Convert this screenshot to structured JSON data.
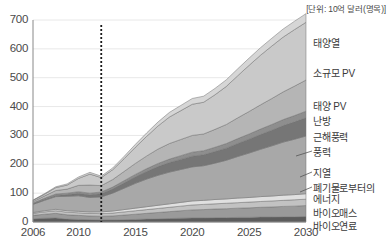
{
  "chart_data": {
    "type": "area",
    "stacked": true,
    "title": "",
    "subtitle": "",
    "unit_note": "[단위: 10억 달러(명목)]",
    "xlabel": "",
    "ylabel": "",
    "xlim": [
      2006,
      2030
    ],
    "ylim": [
      0,
      700
    ],
    "y_ticks": [
      0,
      100,
      200,
      300,
      400,
      500,
      600,
      700
    ],
    "x_ticks": [
      2006,
      2010,
      2015,
      2020,
      2025,
      2030
    ],
    "x_tick_labels": [
      "2006",
      "2010",
      "2015",
      "2020",
      "2025",
      "2030"
    ],
    "y_tick_labels": [
      "0",
      "100",
      "200",
      "300",
      "400",
      "500",
      "600",
      "700"
    ],
    "grid": true,
    "legend_position": "right-inline",
    "annotations": [
      {
        "name": "forecast-divider",
        "type": "vline",
        "x": 2012,
        "style": "dotted",
        "color": "#1a1a1a"
      }
    ],
    "x": [
      2006,
      2007,
      2008,
      2009,
      2010,
      2011,
      2012,
      2013,
      2014,
      2015,
      2016,
      2017,
      2018,
      2019,
      2020,
      2021,
      2022,
      2023,
      2024,
      2025,
      2026,
      2027,
      2028,
      2029,
      2030
    ],
    "series": [
      {
        "name": "바이오연료",
        "color": "#5c5c5c",
        "values": [
          11,
          13,
          14,
          10,
          9,
          8,
          7,
          7,
          8,
          9,
          10,
          11,
          12,
          13,
          14,
          14,
          15,
          15,
          16,
          16,
          17,
          17,
          18,
          18,
          19
        ]
      },
      {
        "name": "바이오매스",
        "color": "#9a9a9a",
        "values": [
          12,
          14,
          16,
          15,
          14,
          13,
          13,
          14,
          16,
          18,
          20,
          22,
          24,
          26,
          28,
          29,
          30,
          31,
          32,
          33,
          34,
          35,
          36,
          37,
          38
        ]
      },
      {
        "name": "폐기물로부터의 에너지",
        "color": "#c2c2c2",
        "values": [
          7,
          8,
          9,
          9,
          9,
          9,
          9,
          10,
          11,
          12,
          13,
          14,
          15,
          16,
          17,
          18,
          18,
          19,
          19,
          20,
          20,
          21,
          21,
          22,
          22
        ]
      },
      {
        "name": "지열",
        "color": "#e0e0e0",
        "values": [
          3,
          4,
          5,
          5,
          5,
          5,
          6,
          7,
          8,
          9,
          10,
          11,
          12,
          13,
          14,
          14,
          15,
          15,
          16,
          16,
          17,
          17,
          18,
          18,
          19
        ]
      },
      {
        "name": "풍력",
        "color": "#a8a8a8",
        "values": [
          28,
          36,
          44,
          50,
          54,
          50,
          52,
          62,
          74,
          86,
          96,
          104,
          110,
          114,
          118,
          120,
          126,
          134,
          144,
          154,
          164,
          174,
          184,
          192,
          200
        ]
      },
      {
        "name": "근해풍력",
        "color": "#767676",
        "values": [
          2,
          3,
          4,
          6,
          8,
          9,
          11,
          14,
          18,
          22,
          26,
          30,
          33,
          35,
          37,
          38,
          40,
          42,
          45,
          48,
          51,
          54,
          57,
          60,
          63
        ]
      },
      {
        "name": "난방",
        "color": "#8e8e8e",
        "values": [
          3,
          4,
          5,
          5,
          6,
          6,
          6,
          7,
          8,
          9,
          10,
          11,
          12,
          13,
          14,
          14,
          15,
          16,
          17,
          18,
          19,
          20,
          21,
          22,
          23
        ]
      },
      {
        "name": "태양 PV",
        "color": "#b5b5b5",
        "values": [
          5,
          8,
          12,
          14,
          22,
          28,
          22,
          26,
          32,
          38,
          44,
          50,
          54,
          56,
          58,
          58,
          62,
          66,
          72,
          78,
          84,
          90,
          96,
          102,
          108
        ]
      },
      {
        "name": "소규모 PV",
        "color": "#c9c9c9",
        "values": [
          4,
          6,
          10,
          14,
          24,
          38,
          28,
          34,
          44,
          56,
          68,
          80,
          92,
          100,
          108,
          110,
          120,
          132,
          146,
          160,
          172,
          182,
          190,
          196,
          200
        ]
      },
      {
        "name": "태양열",
        "color": "#d6d6d6",
        "values": [
          1,
          2,
          3,
          4,
          5,
          6,
          5,
          6,
          8,
          10,
          12,
          14,
          16,
          18,
          20,
          21,
          22,
          23,
          24,
          25,
          26,
          27,
          28,
          29,
          30
        ]
      }
    ],
    "series_labels_right": [
      {
        "label": "태양열",
        "top": 38,
        "leader": false
      },
      {
        "label": "소규모 PV",
        "top": 68,
        "leader": false
      },
      {
        "label": "태양 PV",
        "top": 101,
        "leader": false
      },
      {
        "label": "난방",
        "top": 116,
        "leader": false
      },
      {
        "label": "근해풍력",
        "top": 132,
        "leader": false
      },
      {
        "label": "풍력",
        "top": 147,
        "leader": true
      },
      {
        "label": "지열",
        "top": 168,
        "leader": true
      },
      {
        "label": "폐기물로부터의",
        "top": 183,
        "leader": true
      },
      {
        "label": "에너지",
        "top": 194,
        "leader": false
      },
      {
        "label": "바이오매스",
        "top": 208,
        "leader": false
      },
      {
        "label": "바이오연료",
        "top": 221,
        "leader": false
      }
    ]
  }
}
